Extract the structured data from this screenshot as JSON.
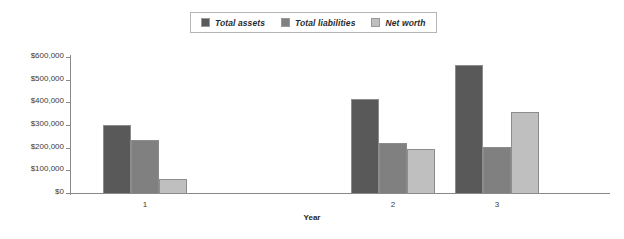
{
  "chart_data": {
    "type": "bar",
    "title": "",
    "subtitle": "",
    "xlabel": "Year",
    "ylabel": "",
    "categories": [
      "1",
      "2",
      "3"
    ],
    "series": [
      {
        "name": "Total assets",
        "values": [
          298000,
          415000,
          565000
        ],
        "color": "#595959"
      },
      {
        "name": "Total liabilities",
        "values": [
          235000,
          220000,
          202000
        ],
        "color": "#808080"
      },
      {
        "name": "Net worth",
        "values": [
          62000,
          196000,
          358000
        ],
        "color": "#bfbfbf"
      }
    ],
    "ylim": [
      0,
      600000
    ],
    "yticks": [
      0,
      100000,
      200000,
      300000,
      400000,
      500000,
      600000
    ],
    "ytick_labels": [
      "$0",
      "$100,000",
      "$200,000",
      "$300,000",
      "$400,000",
      "$500,000",
      "$600,000"
    ],
    "grid": false,
    "legend_position": "top-center",
    "legend_entries": [
      "Total assets",
      "Total liabilities",
      "Net worth"
    ]
  }
}
